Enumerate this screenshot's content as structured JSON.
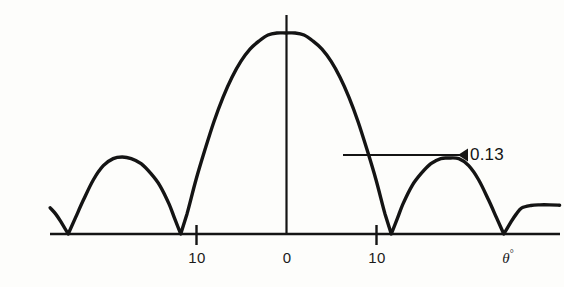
{
  "figure": {
    "name": "antenna-radiation-pattern",
    "background_color": "#fdfdfb",
    "ink_color": "#141414"
  },
  "annotations": [
    {
      "id": "sidelobe-level",
      "text": "0.13",
      "leader_line": {
        "x1": 343,
        "x2": 468,
        "y": 155
      },
      "label_x": 470,
      "label_y": 146
    }
  ],
  "axis": {
    "baseline": {
      "x1": 50,
      "x2": 560,
      "y": 234
    },
    "vertical": {
      "x": 286,
      "y1": 15,
      "y2": 234
    },
    "tick_marks": [
      {
        "x": 196,
        "y1": 226,
        "y2": 244
      },
      {
        "x": 376,
        "y1": 226,
        "y2": 244
      }
    ],
    "center_tick": {
      "x": 286,
      "y1": 226,
      "y2": 234
    },
    "tick_labels": [
      {
        "text": "10",
        "x": 197,
        "y": 250
      },
      {
        "text": "0",
        "x": 287,
        "y": 250
      },
      {
        "text": "10",
        "x": 377,
        "y": 250
      }
    ],
    "axis_label": {
      "symbol": "θ",
      "unit": "°",
      "x": 508,
      "y": 249
    }
  },
  "chart_data": {
    "type": "line",
    "title": "",
    "subtitle": "",
    "xlabel": "θ°",
    "ylabel": "",
    "grid": false,
    "legend": null,
    "xlim": [
      -26.2,
      30.4
    ],
    "ylim": [
      0,
      1
    ],
    "xticks": [
      -10,
      0,
      10
    ],
    "xticklabels": [
      "10",
      "0",
      "10"
    ],
    "peak_value": 1.0,
    "first_sidelobe_level": 0.13,
    "null_angles_deg": [
      -24.2,
      -11.7,
      11.7,
      24.2
    ],
    "lobes": [
      {
        "name": "left-outer-partial-lobe",
        "peak_angle_deg": -28.5,
        "peak_value": 0.145,
        "partial": true
      },
      {
        "name": "left-first-sidelobe",
        "peak_angle_deg": -18.2,
        "peak_value": 0.383
      },
      {
        "name": "main-lobe",
        "peak_angle_deg": 0.0,
        "peak_value": 1.0
      },
      {
        "name": "right-first-sidelobe",
        "peak_angle_deg": 18.0,
        "peak_value": 0.378
      },
      {
        "name": "right-outer-partial-lobe",
        "peak_angle_deg": 28.2,
        "peak_value": 0.145,
        "partial": true
      }
    ],
    "series": [
      {
        "name": "radiation-pattern",
        "x": [
          -26.2,
          -25.6,
          -25.0,
          -24.2,
          -23.4,
          -22.5,
          -21.4,
          -20.3,
          -19.2,
          -18.2,
          -17.2,
          -16.1,
          -15.0,
          -14.0,
          -13.0,
          -12.4,
          -11.7,
          -11.0,
          -10.0,
          -9.0,
          -8.0,
          -7.0,
          -6.0,
          -5.0,
          -4.0,
          -3.0,
          -2.0,
          -1.0,
          0.0,
          1.0,
          2.0,
          3.0,
          4.0,
          5.0,
          6.0,
          7.0,
          8.0,
          9.0,
          10.0,
          11.0,
          11.7,
          12.4,
          13.0,
          14.0,
          15.0,
          16.1,
          17.2,
          18.0,
          19.2,
          20.3,
          21.4,
          22.5,
          23.4,
          24.2,
          25.0,
          25.6,
          26.2,
          27.2,
          28.2,
          29.3,
          30.4
        ],
        "y": [
          0.13,
          0.1,
          0.06,
          0.0,
          0.08,
          0.17,
          0.27,
          0.34,
          0.375,
          0.383,
          0.375,
          0.35,
          0.3,
          0.24,
          0.15,
          0.08,
          0.0,
          0.1,
          0.27,
          0.42,
          0.56,
          0.68,
          0.78,
          0.86,
          0.92,
          0.96,
          0.99,
          1.0,
          1.0,
          1.0,
          0.99,
          0.96,
          0.92,
          0.86,
          0.78,
          0.68,
          0.56,
          0.42,
          0.27,
          0.1,
          0.0,
          0.08,
          0.15,
          0.24,
          0.3,
          0.35,
          0.375,
          0.378,
          0.375,
          0.34,
          0.27,
          0.17,
          0.08,
          0.0,
          0.06,
          0.1,
          0.13,
          0.142,
          0.145,
          0.145,
          0.143
        ]
      }
    ]
  }
}
